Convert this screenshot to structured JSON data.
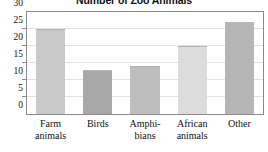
{
  "chart_data": {
    "type": "bar",
    "title": "Number of Zoo Animals",
    "xlabel": "",
    "ylabel": "",
    "categories": [
      "Farm animals",
      "Birds",
      "Amphibians",
      "African animals",
      "Other"
    ],
    "category_lines": [
      [
        "Farm",
        "animals"
      ],
      [
        "Birds",
        ""
      ],
      [
        "Amphi-",
        "bians"
      ],
      [
        "African",
        "animals"
      ],
      [
        "Other",
        ""
      ]
    ],
    "values": [
      25,
      13,
      14,
      20,
      27
    ],
    "ylim": [
      0,
      30
    ],
    "yticks": [
      0,
      5,
      10,
      15,
      20,
      25,
      30
    ],
    "ytick_labels": [
      "0",
      "5",
      "10",
      "15",
      "20",
      "25",
      "30"
    ],
    "grid": true,
    "legend": false,
    "bar_colors": [
      "#c9c9c9",
      "#a8a8a8",
      "#bdbdbd",
      "#dcdcdc",
      "#b5b5b5"
    ],
    "frame_color": "#8a8a8a",
    "grid_color": "#e2e2e2",
    "text_color": "#111111"
  }
}
